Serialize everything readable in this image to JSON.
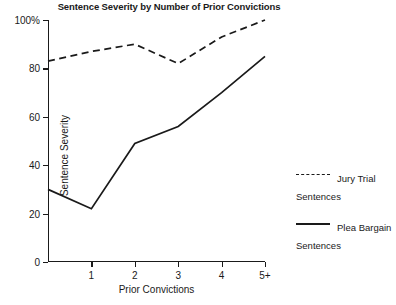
{
  "chart_data": {
    "type": "line",
    "title": "Sentence Severity by Number of Prior Convictions",
    "xlabel": "Prior Convictions",
    "ylabel": "Sentence Severity",
    "categories": [
      "0",
      "1",
      "2",
      "3",
      "4",
      "5+"
    ],
    "x_tick_labels": [
      "",
      "1",
      "2",
      "3",
      "4",
      "5+"
    ],
    "y_tick_labels": [
      "0",
      "20",
      "40",
      "60",
      "80",
      "100%"
    ],
    "y_tick_values": [
      0,
      20,
      40,
      60,
      80,
      100
    ],
    "ylim": [
      0,
      100
    ],
    "xlim": [
      0,
      5
    ],
    "grid": false,
    "legend_position": "right",
    "series": [
      {
        "name": "Jury Trial Sentences",
        "style": "dashed",
        "color": "#1a1a1a",
        "values": [
          83,
          87,
          90,
          82,
          93,
          100
        ]
      },
      {
        "name": "Plea Bargain Sentences",
        "style": "solid",
        "color": "#1a1a1a",
        "values": [
          30,
          22,
          49,
          56,
          70,
          85
        ]
      }
    ]
  },
  "legend": {
    "entries": [
      {
        "label": "Jury Trial\nSentences",
        "style": "dashed"
      },
      {
        "label": "Plea Bargain\nSentences",
        "style": "solid"
      }
    ]
  },
  "colors": {
    "ink": "#1a1a1a",
    "background": "#ffffff"
  }
}
